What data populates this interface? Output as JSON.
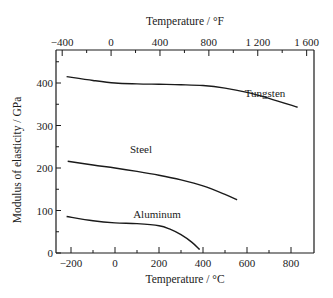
{
  "chart_data": {
    "type": "line",
    "title": "",
    "xlabel": "Temperature / °C",
    "ylabel": "Modulus of elasticity / GPa",
    "x2label": "Temperature / °F",
    "xlim": [
      -250,
      900
    ],
    "ylim": [
      0,
      470
    ],
    "x_ticks": [
      -200,
      0,
      200,
      400,
      600,
      800
    ],
    "x_tick_labels": [
      "−200",
      "0",
      "200",
      "400",
      "600",
      "800"
    ],
    "x_minor_ticks": [
      -100,
      100,
      300,
      500,
      700
    ],
    "y_ticks": [
      0,
      100,
      200,
      300,
      400
    ],
    "y_tick_labels": [
      "0",
      "100",
      "200",
      "300",
      "400"
    ],
    "y_minor_ticks": [
      50,
      150,
      250,
      350,
      450
    ],
    "x2_ticks_F": [
      -400,
      0,
      400,
      800,
      1200,
      1600
    ],
    "x2_tick_labels": [
      "−400",
      "0",
      "400",
      "800",
      "1 200",
      "1 600"
    ],
    "x2_minor_ticks_F": [
      -200,
      200,
      600,
      1000,
      1400
    ],
    "grid": false,
    "legend": "none (curves labeled inline)",
    "series": [
      {
        "name": "Tungsten",
        "x": [
          -220,
          -100,
          0,
          100,
          200,
          300,
          400,
          500,
          600,
          700,
          830
        ],
        "y": [
          415,
          406,
          400,
          398,
          397,
          396,
          394,
          388,
          378,
          364,
          343
        ]
      },
      {
        "name": "Steel",
        "x": [
          -215,
          -100,
          0,
          100,
          200,
          300,
          400,
          500,
          555
        ],
        "y": [
          216,
          207,
          200,
          192,
          183,
          172,
          158,
          138,
          125
        ]
      },
      {
        "name": "Aluminum",
        "x": [
          -220,
          -100,
          0,
          100,
          200,
          250,
          300,
          350,
          385
        ],
        "y": [
          86,
          76,
          71,
          69,
          64,
          56,
          43,
          25,
          8
        ]
      }
    ]
  }
}
